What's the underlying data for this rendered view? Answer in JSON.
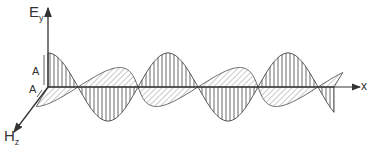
{
  "diagram": {
    "labels": {
      "e_axis": "E",
      "e_axis_sub": "y",
      "h_axis": "H",
      "h_axis_sub": "z",
      "x_axis": "x",
      "amp_e": "A",
      "amp_h": "A"
    },
    "colors": {
      "stroke": "#333333",
      "background": "#ffffff"
    },
    "wave": {
      "origin_x": 48,
      "axis_y": 87,
      "half_period_px": 60,
      "e_amplitude_px": 34,
      "h_amplitude_px": 26,
      "end_x": 334,
      "e_hatch": "vertical",
      "h_hatch": "diagonal"
    }
  }
}
